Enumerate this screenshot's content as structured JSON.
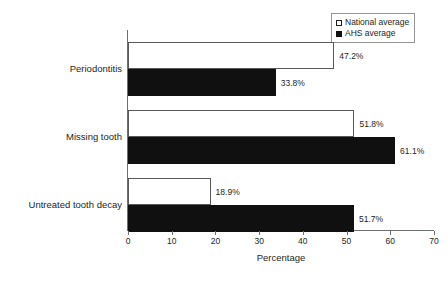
{
  "chart_data": {
    "type": "bar",
    "orientation": "horizontal",
    "title": "",
    "xlabel": "Percentage",
    "ylabel": "",
    "xlim": [
      0,
      70
    ],
    "xticks": [
      0,
      10,
      20,
      30,
      40,
      50,
      60,
      70
    ],
    "grid": false,
    "legend_position": "top-right",
    "categories": [
      "Periodontitis",
      "Missing tooth",
      "Untreated tooth decay"
    ],
    "series": [
      {
        "name": "National average",
        "style": "open",
        "color": "#ffffff",
        "border_color": "#58595b",
        "values": [
          47.2,
          51.8,
          18.9
        ],
        "labels": [
          "47.2%",
          "51.8%",
          "18.9%"
        ]
      },
      {
        "name": "AHS average",
        "style": "filled",
        "color": "#101010",
        "border_color": "#101010",
        "values": [
          33.8,
          61.1,
          51.7
        ],
        "labels": [
          "33.8%",
          "61.1%",
          "51.7%"
        ]
      }
    ]
  },
  "legend": {
    "entries": [
      {
        "label": "National average",
        "swatch": "open-square-icon"
      },
      {
        "label": "AHS average",
        "swatch": "filled-square-icon"
      }
    ]
  },
  "axis": {
    "x_title": "Percentage",
    "tick_labels": [
      "0",
      "10",
      "20",
      "30",
      "40",
      "50",
      "60",
      "70"
    ]
  }
}
